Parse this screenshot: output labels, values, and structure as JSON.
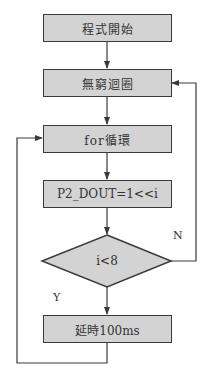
{
  "colors": {
    "fill": "#d3d3d3",
    "stroke": "#3a3a3a",
    "background": "#ffffff"
  },
  "nodes": {
    "start": {
      "label": "程式開始",
      "type": "process"
    },
    "loop": {
      "label": "無窮迴圈",
      "type": "process"
    },
    "for": {
      "label": "for循環",
      "type": "process"
    },
    "output": {
      "label": "P2_DOUT=1<<i",
      "type": "process"
    },
    "decision": {
      "label": "i<8",
      "type": "decision"
    },
    "delay": {
      "label": "延時100ms",
      "type": "process"
    }
  },
  "edges": {
    "yes_label": "Y",
    "no_label": "N"
  }
}
